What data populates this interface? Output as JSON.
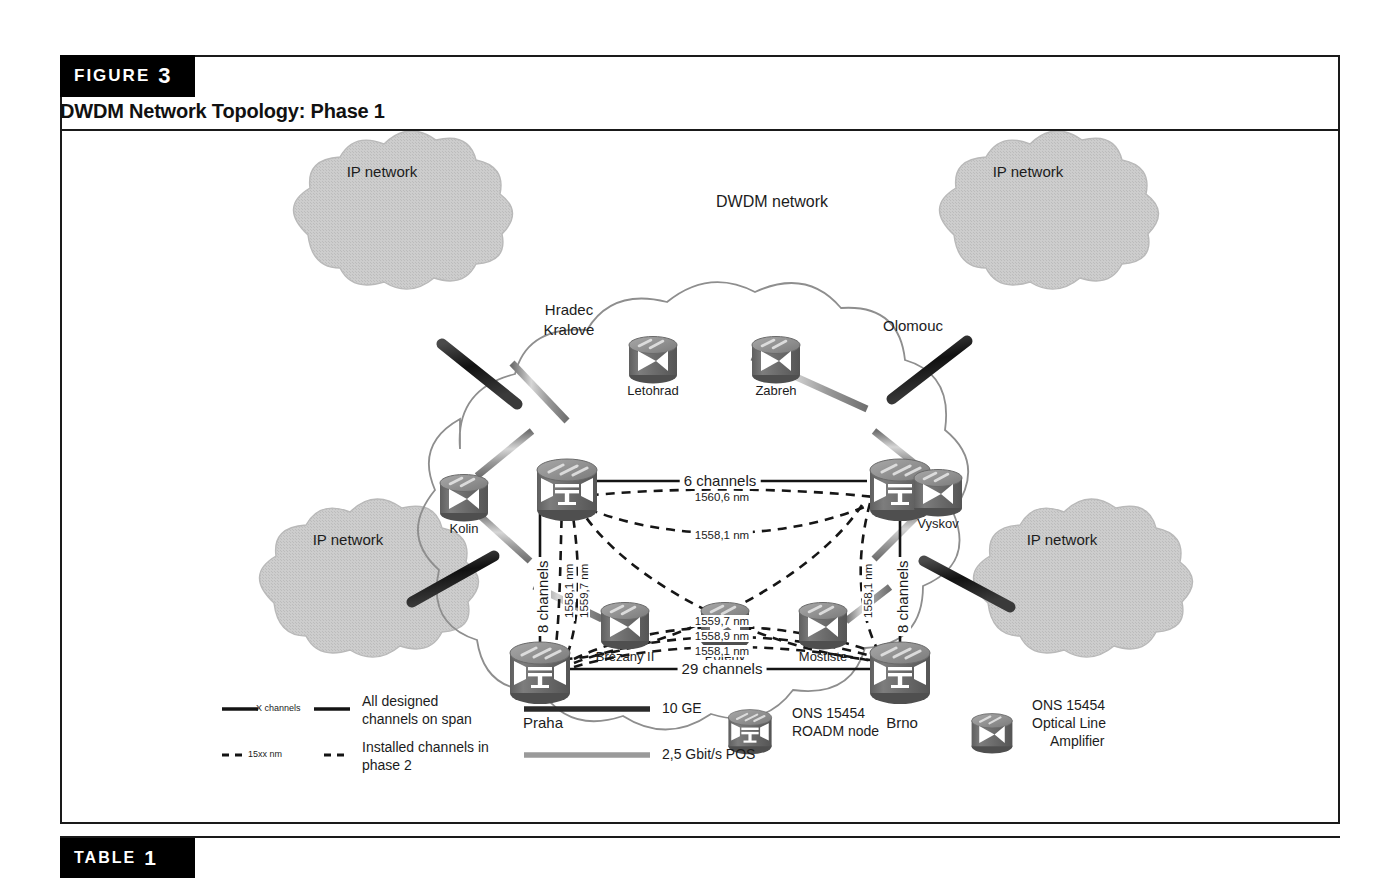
{
  "figure": {
    "badge_word": "FIGURE",
    "badge_number": "3",
    "title": "DWDM Network Topology: Phase 1"
  },
  "table": {
    "badge_word": "TABLE",
    "badge_number": "1"
  },
  "diagram": {
    "dwdm_cloud_label": "DWDM network",
    "ip_clouds": [
      {
        "label": "IP network",
        "position": "top-left"
      },
      {
        "label": "IP network",
        "position": "top-right"
      },
      {
        "label": "IP network",
        "position": "bottom-left"
      },
      {
        "label": "IP network",
        "position": "bottom-right"
      }
    ],
    "roadm_nodes": [
      {
        "label": "Hradec\nKralove",
        "line1": "Hradec",
        "line2": "Kralove"
      },
      {
        "label": "Olomouc",
        "line1": "Olomouc",
        "line2": ""
      },
      {
        "label": "Praha",
        "line1": "Praha",
        "line2": ""
      },
      {
        "label": "Brno",
        "line1": "Brno",
        "line2": ""
      }
    ],
    "amplifier_nodes": [
      {
        "label": "Letohrad"
      },
      {
        "label": "Zabreh"
      },
      {
        "label": "Kolin"
      },
      {
        "label": "Vyskov"
      },
      {
        "label": "Brezany II"
      },
      {
        "label": "Potehy"
      },
      {
        "label": "Mostiste"
      }
    ],
    "span_labels": [
      {
        "text": "6 channels",
        "span": "Hradec Kralove - Olomouc",
        "orientation": "horizontal"
      },
      {
        "text": "29 channels",
        "span": "Praha - Brno",
        "orientation": "horizontal"
      },
      {
        "text": "8 channels",
        "span": "Hradec Kralove - Praha",
        "orientation": "vertical"
      },
      {
        "text": "8 channels",
        "span": "Olomouc - Brno",
        "orientation": "vertical"
      }
    ],
    "wavelength_labels": [
      {
        "text": "1560,6 nm",
        "span": "Hradec Kralove - Olomouc"
      },
      {
        "text": "1558,1 nm",
        "span": "Hradec Kralove - Olomouc"
      },
      {
        "text": "1559,7 nm",
        "span": "Hradec Kralove - Praha"
      },
      {
        "text": "1558,1 nm",
        "span": "Hradec Kralove - Praha"
      },
      {
        "text": "1558,1 nm",
        "span": "Olomouc - Brno"
      },
      {
        "text": "1559,7 nm",
        "span": "Praha - Brno"
      },
      {
        "text": "1558,9 nm",
        "span": "Praha - Brno"
      },
      {
        "text": "1558,1 nm",
        "span": "Praha - Brno"
      }
    ],
    "legend": {
      "items": [
        {
          "key": "X channels",
          "desc_line1": "All designed",
          "desc_line2": "channels on span",
          "style": "solid-dark"
        },
        {
          "key": "15xx nm",
          "desc_line1": "Installed channels in",
          "desc_line2": "phase 2",
          "style": "dashed-dark"
        },
        {
          "key": "",
          "desc_line1": "10 GE",
          "desc_line2": "",
          "style": "thick-dark-line"
        },
        {
          "key": "",
          "desc_line1": "2,5 Gbit/s POS",
          "desc_line2": "",
          "style": "thick-gray-line"
        },
        {
          "key": "",
          "desc_line1": "ONS 15454",
          "desc_line2": "ROADM node",
          "style": "roadm-icon"
        },
        {
          "key": "",
          "desc_line1": "ONS 15454",
          "desc_line2": "Optical Line",
          "desc_line3": "Amplifier",
          "style": "amplifier-icon"
        }
      ]
    }
  },
  "colors": {
    "badge_bg": "#000000",
    "badge_fg": "#ffffff",
    "frame": "#1a1a1a",
    "cloud_fill": "#c9c9c9",
    "cloud_stroke": "#b5b5b5",
    "dwdm_outline": "#8e8e8e",
    "node_body": "#6e6e6e",
    "node_top": "#9a9a9a",
    "node_glyph": "#ffffff",
    "link_dark": "#1a1a1a",
    "link_gray": "#9e9e9e",
    "text": "#1c1c1c"
  }
}
